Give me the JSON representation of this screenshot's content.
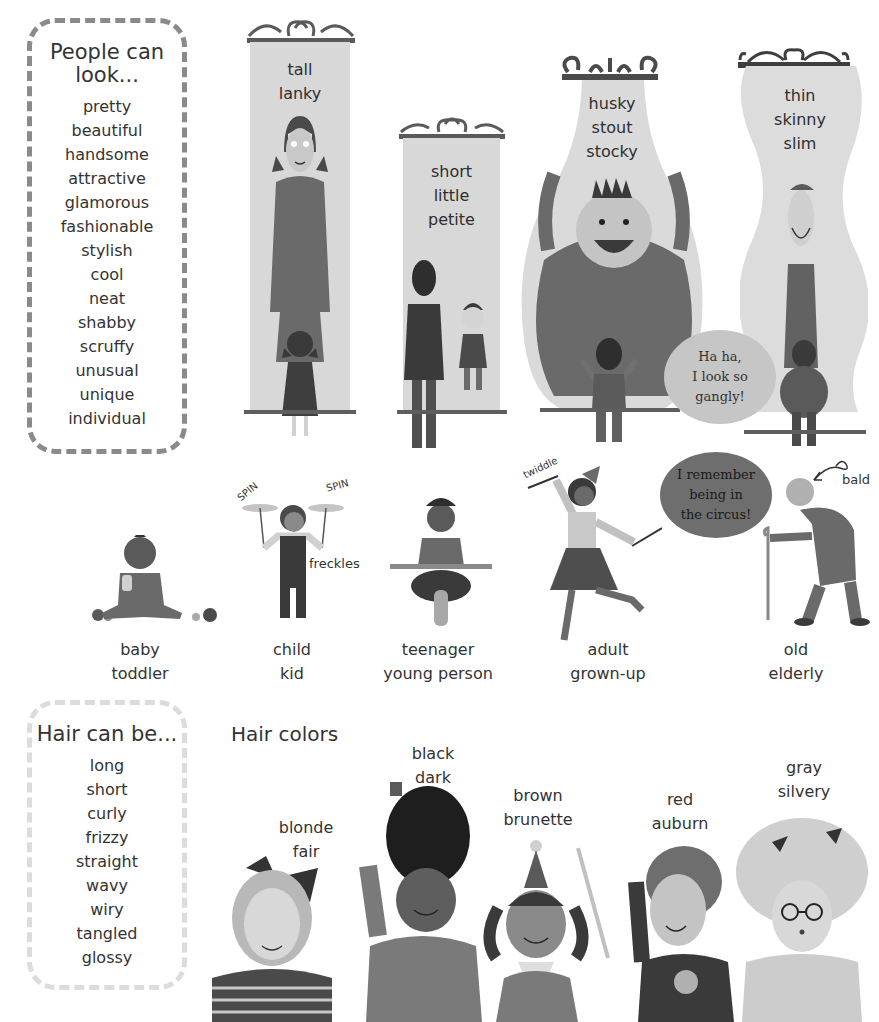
{
  "looks_box": {
    "title_line1": "People can",
    "title_line2": "look...",
    "words": [
      "pretty",
      "beautiful",
      "handsome",
      "attractive",
      "glamorous",
      "fashionable",
      "stylish",
      "cool",
      "neat",
      "shabby",
      "scruffy",
      "unusual",
      "unique",
      "individual"
    ]
  },
  "mirrors": [
    {
      "id": "tall",
      "lines": [
        "tall",
        "lanky"
      ]
    },
    {
      "id": "short",
      "lines": [
        "short",
        "little",
        "petite"
      ]
    },
    {
      "id": "husky",
      "lines": [
        "husky",
        "stout",
        "stocky"
      ]
    },
    {
      "id": "thin",
      "lines": [
        "thin",
        "skinny",
        "slim"
      ]
    }
  ],
  "speech_bubbles": {
    "gangly": [
      "Ha ha,",
      "I look so",
      "gangly!"
    ],
    "circus": [
      "I remember",
      "being in",
      "the circus!"
    ]
  },
  "ages": [
    {
      "id": "baby",
      "lines": [
        "baby",
        "toddler"
      ]
    },
    {
      "id": "child",
      "lines": [
        "child",
        "kid"
      ]
    },
    {
      "id": "teenager",
      "lines": [
        "teenager",
        "young person"
      ]
    },
    {
      "id": "adult",
      "lines": [
        "adult",
        "grown-up"
      ]
    },
    {
      "id": "old",
      "lines": [
        "old",
        "elderly"
      ]
    }
  ],
  "annotations": {
    "spin_left": "SPIN",
    "spin_right": "SPIN",
    "freckles": "freckles",
    "twiddle": "twiddle",
    "bald": "bald"
  },
  "hair_box": {
    "title": "Hair can be...",
    "words": [
      "long",
      "short",
      "curly",
      "frizzy",
      "straight",
      "wavy",
      "wiry",
      "tangled",
      "glossy"
    ]
  },
  "hair_colors": {
    "title": "Hair colors",
    "items": [
      {
        "id": "blonde",
        "lines": [
          "blonde",
          "fair"
        ],
        "hair_color": "#b8b8b8"
      },
      {
        "id": "black",
        "lines": [
          "black",
          "dark"
        ],
        "hair_color": "#1e1e1e"
      },
      {
        "id": "brown",
        "lines": [
          "brown",
          "brunette"
        ],
        "hair_color": "#4a4a4a"
      },
      {
        "id": "red",
        "lines": [
          "red",
          "auburn"
        ],
        "hair_color": "#6e6e6e"
      },
      {
        "id": "gray",
        "lines": [
          "gray",
          "silvery"
        ],
        "hair_color": "#cfcfcf"
      }
    ]
  }
}
